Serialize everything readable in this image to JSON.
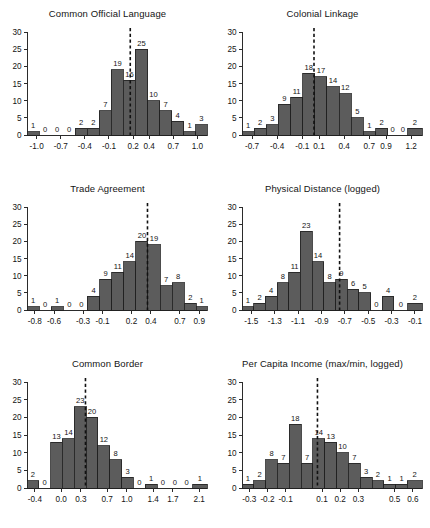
{
  "figure": {
    "panel_count": 6,
    "bar_color": "#5c5c5c",
    "mean_line_color": "#111111",
    "axis_color": "#2b2b2b"
  },
  "chart_data": [
    {
      "type": "bar",
      "title": "Common Official Language",
      "xlabel": "",
      "ylabel": "",
      "ylim": [
        0,
        30
      ],
      "yticks": [
        0,
        5,
        10,
        15,
        20,
        25,
        30
      ],
      "xticks": [
        "-1.0",
        "-0.7",
        "-0.4",
        "-0.1",
        "0.2",
        "0.4",
        "0.7",
        "1.0"
      ],
      "xtick_values": [
        -1.0,
        -0.7,
        -0.4,
        -0.1,
        0.2,
        0.4,
        0.7,
        1.0
      ],
      "xlim": [
        -1.12,
        1.12
      ],
      "bin_edges": [
        -1.12,
        -0.97,
        -0.82,
        -0.67,
        -0.52,
        -0.37,
        -0.22,
        -0.07,
        0.08,
        0.23,
        0.38,
        0.53,
        0.68,
        0.83,
        0.98,
        1.12
      ],
      "values": [
        1,
        0,
        0,
        0,
        2,
        2,
        7,
        19,
        16,
        25,
        10,
        7,
        4,
        1,
        3
      ],
      "mean_line": 0.165,
      "grid": false,
      "legend": "none"
    },
    {
      "type": "bar",
      "title": "Colonial Linkage",
      "xlabel": "",
      "ylabel": "",
      "ylim": [
        0,
        30
      ],
      "yticks": [
        0,
        5,
        10,
        15,
        20,
        25,
        30
      ],
      "xticks": [
        "-0.7",
        "-0.4",
        "-0.1",
        "0.1",
        "0.4",
        "0.7",
        "0.9",
        "1.2"
      ],
      "xtick_values": [
        -0.7,
        -0.4,
        -0.1,
        0.1,
        0.4,
        0.7,
        0.9,
        1.2
      ],
      "xlim": [
        -0.82,
        1.33
      ],
      "bin_edges": [
        -0.82,
        -0.675,
        -0.53,
        -0.385,
        -0.24,
        -0.095,
        0.05,
        0.195,
        0.34,
        0.485,
        0.63,
        0.775,
        0.92,
        1.04,
        1.16,
        1.33
      ],
      "values": [
        1,
        2,
        3,
        9,
        11,
        18,
        17,
        14,
        12,
        5,
        1,
        2,
        0,
        0,
        2
      ],
      "mean_line": 0.04,
      "grid": false,
      "legend": "none"
    },
    {
      "type": "bar",
      "title": "Trade Agreement",
      "xlabel": "",
      "ylabel": "",
      "ylim": [
        0,
        30
      ],
      "yticks": [
        0,
        5,
        10,
        15,
        20,
        25,
        30
      ],
      "xticks": [
        "-0.8",
        "-0.6",
        "-0.3",
        "-0.1",
        "0.2",
        "0.4",
        "0.7",
        "0.9"
      ],
      "xtick_values": [
        -0.8,
        -0.6,
        -0.3,
        -0.1,
        0.2,
        0.4,
        0.7,
        0.9
      ],
      "xlim": [
        -0.88,
        0.98
      ],
      "bin_edges": [
        -0.88,
        -0.755,
        -0.63,
        -0.505,
        -0.38,
        -0.255,
        -0.13,
        -0.005,
        0.12,
        0.245,
        0.37,
        0.495,
        0.62,
        0.745,
        0.87,
        0.98
      ],
      "values": [
        1,
        0,
        1,
        0,
        0,
        4,
        9,
        11,
        14,
        20,
        19,
        7,
        8,
        2,
        1
      ],
      "mean_line": 0.365,
      "grid": false,
      "legend": "none"
    },
    {
      "type": "bar",
      "title": "Physical Distance (logged)",
      "xlabel": "",
      "ylabel": "",
      "ylim": [
        0,
        30
      ],
      "yticks": [
        0,
        5,
        10,
        15,
        20,
        25,
        30
      ],
      "xticks": [
        "-1.5",
        "-1.3",
        "-1.1",
        "-0.9",
        "-0.7",
        "-0.5",
        "-0.3",
        "-0.1"
      ],
      "xtick_values": [
        -1.5,
        -1.3,
        -1.1,
        -0.9,
        -0.7,
        -0.5,
        -0.3,
        -0.1
      ],
      "xlim": [
        -1.58,
        -0.04
      ],
      "bin_edges": [
        -1.58,
        -1.48,
        -1.38,
        -1.28,
        -1.18,
        -1.08,
        -0.98,
        -0.88,
        -0.78,
        -0.68,
        -0.58,
        -0.48,
        -0.38,
        -0.28,
        -0.16,
        -0.04
      ],
      "values": [
        1,
        2,
        4,
        8,
        11,
        23,
        14,
        8,
        9,
        6,
        5,
        0,
        4,
        0,
        2
      ],
      "mean_line": -0.745,
      "grid": false,
      "legend": "none"
    },
    {
      "type": "bar",
      "title": "Common Border",
      "xlabel": "",
      "ylabel": "",
      "ylim": [
        0,
        30
      ],
      "yticks": [
        0,
        5,
        10,
        15,
        20,
        25,
        30
      ],
      "xticks": [
        "-0.4",
        "0.0",
        "0.3",
        "0.7",
        "1.0",
        "1.4",
        "1.7",
        "2.1"
      ],
      "xtick_values": [
        -0.4,
        0.0,
        0.3,
        0.7,
        1.0,
        1.4,
        1.7,
        2.1
      ],
      "xlim": [
        -0.52,
        2.22
      ],
      "bin_edges": [
        -0.52,
        -0.34,
        -0.16,
        0.02,
        0.2,
        0.38,
        0.56,
        0.74,
        0.92,
        1.1,
        1.28,
        1.46,
        1.64,
        1.82,
        2.0,
        2.22
      ],
      "values": [
        2,
        0,
        13,
        14,
        23,
        20,
        12,
        8,
        3,
        0,
        1,
        0,
        0,
        0,
        1
      ],
      "mean_line": 0.37,
      "grid": false,
      "legend": "none"
    },
    {
      "type": "bar",
      "title": "Per Capita Income (max/min, logged)",
      "xlabel": "",
      "ylabel": "",
      "ylim": [
        0,
        30
      ],
      "yticks": [
        0,
        5,
        10,
        15,
        20,
        25,
        30
      ],
      "xticks": [
        "-0.3",
        "-0.2",
        "-0.1",
        "0.1",
        "0.2",
        "0.3",
        "0.5",
        "0.6"
      ],
      "xtick_values": [
        -0.3,
        -0.2,
        -0.1,
        0.1,
        0.2,
        0.3,
        0.5,
        0.6
      ],
      "xlim": [
        -0.34,
        0.65
      ],
      "bin_edges": [
        -0.34,
        -0.275,
        -0.21,
        -0.145,
        -0.08,
        -0.015,
        0.05,
        0.115,
        0.18,
        0.245,
        0.31,
        0.375,
        0.44,
        0.505,
        0.57,
        0.65
      ],
      "values": [
        1,
        2,
        8,
        7,
        18,
        7,
        14,
        13,
        10,
        7,
        3,
        2,
        1,
        1,
        2
      ],
      "mean_line": 0.075,
      "grid": false,
      "legend": "none"
    }
  ]
}
